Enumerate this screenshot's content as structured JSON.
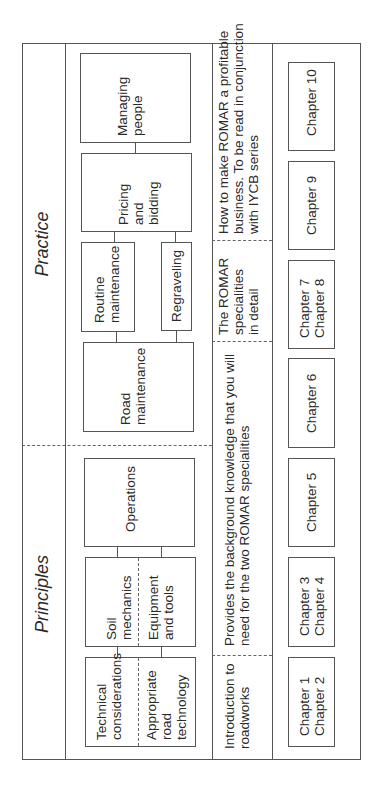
{
  "diagram": {
    "orientation": "rotated-90-ccw",
    "sections": [
      {
        "id": "principles",
        "label": "Principles"
      },
      {
        "id": "practice",
        "label": "Practice"
      }
    ],
    "topics": {
      "technical_considerations": "Technical\nconsiderations",
      "appropriate_road_technology": "Appropriate\nroad\ntechnology",
      "soil_mechanics": "Soil\nmechanics",
      "equipment_and_tools": "Equipment\nand tools",
      "operations": "Operations",
      "road_maintenance": "Road\nmaintenance",
      "routine_maintenance": "Routine\nmaintenance",
      "regraveling": "Regraveling",
      "pricing_and_bidding": "Pricing\nand\nbidding",
      "managing_people": "Managing\npeople"
    },
    "descriptions": {
      "intro": "Introduction to\nroadworks",
      "background": "Provides the background knowledge that you will\nneed for the two ROMAR specialities",
      "specialities": "The  ROMAR\nspecialities\nin detail",
      "business": "How to make ROMAR a profitable\nbusiness. To be read in conjunction\nwith IYCB series"
    },
    "chapters": [
      {
        "label": "Chapter 1\nChapter 2"
      },
      {
        "label": "Chapter 3\nChapter 4"
      },
      {
        "label": "Chapter 5"
      },
      {
        "label": "Chapter 6"
      },
      {
        "label": "Chapter 7\nChapter 8"
      },
      {
        "label": "Chapter 9"
      },
      {
        "label": "Chapter 10"
      }
    ]
  }
}
